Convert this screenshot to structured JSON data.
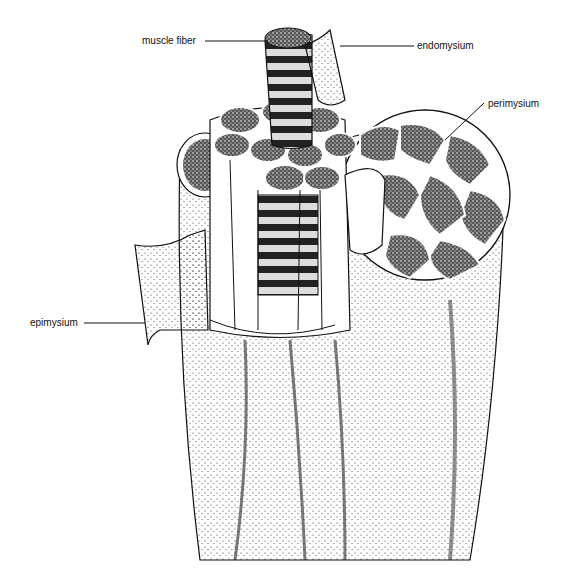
{
  "diagram": {
    "labels": [
      {
        "id": "muscle-fiber",
        "text": "muscle fiber"
      },
      {
        "id": "endomysium",
        "text": "endomysium"
      },
      {
        "id": "perimysium",
        "text": "perimysium"
      },
      {
        "id": "epimysium",
        "text": "epimysium"
      }
    ],
    "colors": {
      "ink": "#111111",
      "background": "#ffffff",
      "stipple": "#333333"
    }
  }
}
